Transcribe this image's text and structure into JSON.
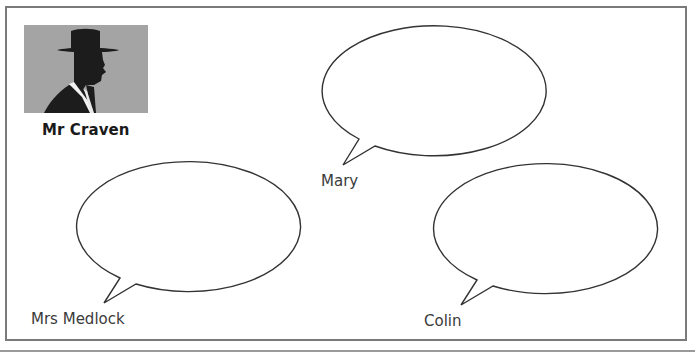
{
  "worksheet": {
    "featured_character": {
      "name": "Mr Craven",
      "image_description": "silhouette of a man in a hat and suit"
    },
    "speech_bubbles": [
      {
        "id": "mary",
        "speaker": "Mary",
        "text": ""
      },
      {
        "id": "mrs-medlock",
        "speaker": "Mrs Medlock",
        "text": ""
      },
      {
        "id": "colin",
        "speaker": "Colin",
        "text": ""
      }
    ]
  },
  "colors": {
    "frame_border": "#7a7a7a",
    "bubble_stroke": "#333333",
    "portrait_background": "#a4a4a4",
    "silhouette": "#1c1c1c"
  }
}
